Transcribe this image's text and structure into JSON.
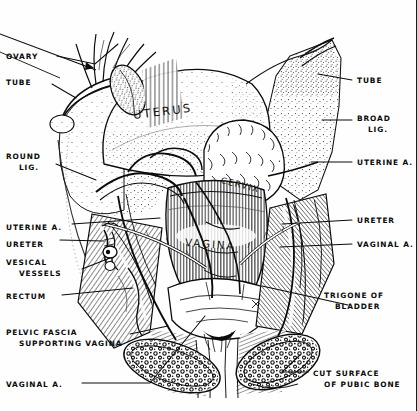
{
  "plate": {
    "title": "Surgical anatomy of the female pelvic organs",
    "style": "line engraving / stipple"
  },
  "ink": {
    "line": "#0b0b0b",
    "mid": "#3a3a3a",
    "light": "#8a8a8a",
    "paper": "#fefefe"
  },
  "organ_labels": [
    {
      "name": "uterus-label",
      "text": "UTERUS",
      "x": 133,
      "y": 110,
      "rot": -7,
      "size": 11.5,
      "spacing": 2.2
    },
    {
      "name": "cervix-label",
      "text": "CERVIX",
      "x": 221,
      "y": 175,
      "rot": 14,
      "size": 8.6,
      "spacing": 1.4
    },
    {
      "name": "vagina-label",
      "text": "VAGINA",
      "x": 185,
      "y": 237,
      "rot": 4,
      "size": 10.5,
      "spacing": 1.8
    }
  ],
  "callouts_left": [
    {
      "name": "ovary",
      "lines": [
        "OVARY"
      ],
      "x": 6,
      "y": 52,
      "indent": false
    },
    {
      "name": "tube-left",
      "lines": [
        "TUBE"
      ],
      "x": 6,
      "y": 78,
      "indent": false
    },
    {
      "name": "round-lig",
      "lines": [
        "ROUND",
        "LIG."
      ],
      "x": 6,
      "y": 152,
      "indent": true
    },
    {
      "name": "uterine-artery-left",
      "lines": [
        "UTERINE A."
      ],
      "x": 6,
      "y": 223,
      "indent": false
    },
    {
      "name": "ureter-left",
      "lines": [
        "URETER"
      ],
      "x": 6,
      "y": 240,
      "indent": false
    },
    {
      "name": "vesical-vessels",
      "lines": [
        "VESICAL",
        "VESSELS"
      ],
      "x": 6,
      "y": 258,
      "indent": true
    },
    {
      "name": "rectum",
      "lines": [
        "RECTUM"
      ],
      "x": 6,
      "y": 292,
      "indent": false
    },
    {
      "name": "pelvic-fascia",
      "lines": [
        "PELVIC FASCIA",
        "SUPPORTING VAGINA"
      ],
      "x": 6,
      "y": 328,
      "indent": true
    },
    {
      "name": "vaginal-artery-left",
      "lines": [
        "VAGINAL A."
      ],
      "x": 6,
      "y": 380,
      "indent": false
    }
  ],
  "callouts_right": [
    {
      "name": "tube-right",
      "lines": [
        "TUBE"
      ],
      "x": 357,
      "y": 76
    },
    {
      "name": "broad-lig",
      "lines": [
        "BROAD",
        "LIG."
      ],
      "x": 357,
      "y": 114
    },
    {
      "name": "uterine-artery-right",
      "lines": [
        "UTERINE A."
      ],
      "x": 357,
      "y": 158
    },
    {
      "name": "ureter-right",
      "lines": [
        "URETER"
      ],
      "x": 357,
      "y": 216
    },
    {
      "name": "vaginal-artery-right",
      "lines": [
        "VAGINAL A."
      ],
      "x": 357,
      "y": 240
    },
    {
      "name": "trigone-of-bladder",
      "lines": [
        "TRIGONE OF",
        "BLADDER"
      ],
      "x": 324,
      "y": 291
    },
    {
      "name": "cut-surface-pubic",
      "lines": [
        "CUT SURFACE",
        "OF PUBIC BONE"
      ],
      "x": 313,
      "y": 369
    }
  ],
  "leaders": [
    {
      "name": "leader-ovary",
      "path": "M 57 56 L 95 64 L 118 44"
    },
    {
      "name": "leader-tube-left",
      "path": "M 52 84 L 76 98"
    },
    {
      "name": "leader-round-lig",
      "path": "M 56 164 L 96 180"
    },
    {
      "name": "leader-uterine-a-left",
      "path": "M 72 224 L 160 218"
    },
    {
      "name": "leader-ureter-left",
      "path": "M 60 240 L 104 241"
    },
    {
      "name": "leader-vesical-vessels",
      "path": "M 82 269 L 110 258"
    },
    {
      "name": "leader-rectum",
      "path": "M 62 295 L 133 288"
    },
    {
      "name": "leader-pelvic-fascia",
      "path": "M 130 334 L 168 326"
    },
    {
      "name": "leader-vaginal-a-left",
      "path": "M 82 383 L 150 383 L 205 316"
    },
    {
      "name": "leader-tube-right",
      "path": "M 352 80 L 318 74"
    },
    {
      "name": "leader-broad-lig",
      "path": "M 352 120 L 322 120"
    },
    {
      "name": "leader-uterine-a-right",
      "path": "M 352 162 L 311 162"
    },
    {
      "name": "leader-ureter-right",
      "path": "M 352 220 L 282 224"
    },
    {
      "name": "leader-vaginal-a-right",
      "path": "M 352 244 L 280 247"
    },
    {
      "name": "leader-trigone",
      "path": "M 348 305 L 262 286"
    },
    {
      "name": "leader-cut-surface",
      "path": "M 308 372 L 282 372 L 300 355"
    }
  ]
}
